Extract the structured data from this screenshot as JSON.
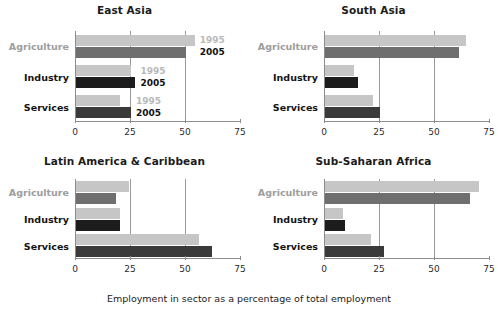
{
  "caption": "Employment in sector as a percentage of total employment",
  "legend": {
    "series_1_label": "1995",
    "series_2_label": "2005"
  },
  "axis": {
    "ticks": [
      "0",
      "25",
      "50",
      "75"
    ],
    "tick_values": [
      0,
      25,
      50,
      75
    ],
    "gridline_values": [
      25,
      50
    ],
    "xmin": 0,
    "xmax": 75
  },
  "categories": [
    "Agriculture",
    "Industry",
    "Services"
  ],
  "colors": {
    "series_1995": "#c6c6c6",
    "series_2005_mid": "#6f6f6f",
    "series_2005_dark": "#1c1c1c",
    "series_2005_deep": "#3a3a3a",
    "axis": "#8c8c8c",
    "label_muted": "#9d9d9d",
    "label_dark": "#141414",
    "title": "#1b1b1b"
  },
  "panels": [
    {
      "title": "East Asia",
      "show_inline_legend": true,
      "rows": [
        {
          "label": "Agriculture",
          "label_style": "muted",
          "v1995": 54,
          "v2005": 50,
          "tone2005": "mid"
        },
        {
          "label": "Industry",
          "label_style": "dark",
          "v1995": 25,
          "v2005": 27,
          "tone2005": "dark"
        },
        {
          "label": "Services",
          "label_style": "dark",
          "v1995": 20,
          "v2005": 25,
          "tone2005": "deep"
        }
      ]
    },
    {
      "title": "South Asia",
      "show_inline_legend": false,
      "rows": [
        {
          "label": "Agriculture",
          "label_style": "muted",
          "v1995": 64,
          "v2005": 61,
          "tone2005": "mid"
        },
        {
          "label": "Industry",
          "label_style": "dark",
          "v1995": 13,
          "v2005": 15,
          "tone2005": "dark"
        },
        {
          "label": "Services",
          "label_style": "dark",
          "v1995": 22,
          "v2005": 25,
          "tone2005": "deep"
        }
      ]
    },
    {
      "title": "Latin America & Caribbean",
      "show_inline_legend": false,
      "rows": [
        {
          "label": "Agriculture",
          "label_style": "muted",
          "v1995": 24,
          "v2005": 18,
          "tone2005": "mid"
        },
        {
          "label": "Industry",
          "label_style": "dark",
          "v1995": 20,
          "v2005": 20,
          "tone2005": "dark"
        },
        {
          "label": "Services",
          "label_style": "dark",
          "v1995": 56,
          "v2005": 62,
          "tone2005": "deep"
        }
      ]
    },
    {
      "title": "Sub-Saharan Africa",
      "show_inline_legend": false,
      "rows": [
        {
          "label": "Agriculture",
          "label_style": "muted",
          "v1995": 70,
          "v2005": 66,
          "tone2005": "mid"
        },
        {
          "label": "Industry",
          "label_style": "dark",
          "v1995": 8,
          "v2005": 9,
          "tone2005": "dark"
        },
        {
          "label": "Services",
          "label_style": "dark",
          "v1995": 21,
          "v2005": 27,
          "tone2005": "deep"
        }
      ]
    }
  ],
  "chart_data": {
    "type": "bar",
    "title": "",
    "subtitle": "",
    "xlabel": "Employment in sector as a percentage of total employment",
    "ylabel": "",
    "orientation": "horizontal",
    "xlim": [
      0,
      75
    ],
    "xticks": [
      0,
      25,
      50,
      75
    ],
    "grid": true,
    "grid_axis": "x",
    "legend_position": "inline-right (East Asia panel only)",
    "categories": [
      "Agriculture",
      "Industry",
      "Services"
    ],
    "panels": [
      {
        "name": "East Asia",
        "series": [
          {
            "name": "1995",
            "values": [
              54,
              25,
              20
            ]
          },
          {
            "name": "2005",
            "values": [
              50,
              27,
              25
            ]
          }
        ]
      },
      {
        "name": "South Asia",
        "series": [
          {
            "name": "1995",
            "values": [
              64,
              13,
              22
            ]
          },
          {
            "name": "2005",
            "values": [
              61,
              15,
              25
            ]
          }
        ]
      },
      {
        "name": "Latin America & Caribbean",
        "series": [
          {
            "name": "1995",
            "values": [
              24,
              20,
              56
            ]
          },
          {
            "name": "2005",
            "values": [
              18,
              20,
              62
            ]
          }
        ]
      },
      {
        "name": "Sub-Saharan Africa",
        "series": [
          {
            "name": "1995",
            "values": [
              70,
              8,
              21
            ]
          },
          {
            "name": "2005",
            "values": [
              66,
              9,
              27
            ]
          }
        ]
      }
    ]
  }
}
